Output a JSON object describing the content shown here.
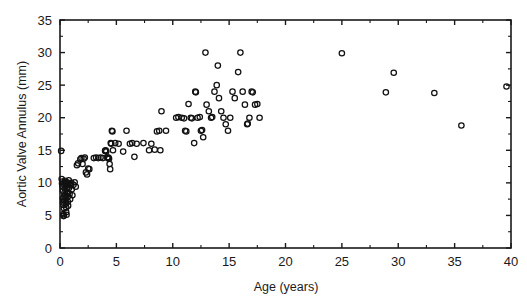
{
  "chart_data": {
    "type": "scatter",
    "title": "",
    "xlabel": "Age  (years)",
    "ylabel": "Aortic Valve Annulus (mm)",
    "xlim": [
      0,
      40
    ],
    "ylim": [
      0,
      35
    ],
    "x_major_ticks": [
      0,
      5,
      10,
      15,
      20,
      25,
      30,
      35,
      40
    ],
    "y_major_ticks": [
      0,
      5,
      10,
      15,
      20,
      25,
      30,
      35
    ],
    "x_tick_labels": [
      "0",
      "5",
      "10",
      "15",
      "20",
      "25",
      "30",
      "35",
      "40"
    ],
    "y_tick_labels": [
      "0",
      "5",
      "10",
      "15",
      "20",
      "25",
      "30",
      "35"
    ],
    "x_minor_interval": 2.5,
    "y_minor_interval": 2.5,
    "grid": false,
    "legend": null,
    "marker": "open-circle",
    "marker_color": "#111111",
    "background_color": "#ffffff",
    "frame": "box",
    "tick_direction": "in",
    "series": [
      {
        "name": "Aortic valve annulus vs age",
        "points": [
          [
            0.1,
            14.9
          ],
          [
            0.15,
            10.6
          ],
          [
            0.18,
            9.9
          ],
          [
            0.2,
            10.2
          ],
          [
            0.22,
            9.4
          ],
          [
            0.25,
            8.8
          ],
          [
            0.25,
            7.6
          ],
          [
            0.28,
            7.0
          ],
          [
            0.3,
            6.6
          ],
          [
            0.3,
            5.2
          ],
          [
            0.32,
            4.9
          ],
          [
            0.33,
            5.0
          ],
          [
            0.35,
            6.1
          ],
          [
            0.35,
            7.3
          ],
          [
            0.38,
            8.0
          ],
          [
            0.4,
            8.5
          ],
          [
            0.4,
            9.6
          ],
          [
            0.42,
            10.0
          ],
          [
            0.45,
            10.3
          ],
          [
            0.45,
            9.1
          ],
          [
            0.48,
            8.2
          ],
          [
            0.5,
            7.8
          ],
          [
            0.5,
            7.2
          ],
          [
            0.52,
            6.8
          ],
          [
            0.55,
            6.2
          ],
          [
            0.55,
            5.5
          ],
          [
            0.58,
            5.1
          ],
          [
            0.6,
            8.6
          ],
          [
            0.6,
            9.8
          ],
          [
            0.62,
            10.1
          ],
          [
            0.65,
            9.3
          ],
          [
            0.68,
            8.4
          ],
          [
            0.7,
            7.9
          ],
          [
            0.7,
            7.1
          ],
          [
            0.72,
            6.5
          ],
          [
            0.75,
            9.9
          ],
          [
            0.78,
            10.4
          ],
          [
            0.8,
            9.2
          ],
          [
            0.85,
            8.3
          ],
          [
            0.9,
            7.5
          ],
          [
            0.95,
            9.6
          ],
          [
            1.0,
            10.0
          ],
          [
            1.05,
            9.0
          ],
          [
            1.1,
            8.1
          ],
          [
            1.2,
            9.7
          ],
          [
            1.3,
            10.1
          ],
          [
            1.4,
            9.4
          ],
          [
            1.5,
            12.7
          ],
          [
            1.6,
            13.0
          ],
          [
            1.8,
            13.6
          ],
          [
            1.9,
            13.8
          ],
          [
            2.0,
            12.9
          ],
          [
            2.1,
            13.7
          ],
          [
            2.2,
            13.9
          ],
          [
            2.3,
            11.6
          ],
          [
            2.4,
            11.3
          ],
          [
            2.5,
            12.2
          ],
          [
            2.6,
            12.1
          ],
          [
            3.0,
            13.8
          ],
          [
            3.2,
            13.9
          ],
          [
            3.4,
            13.8
          ],
          [
            3.6,
            13.9
          ],
          [
            3.8,
            13.8
          ],
          [
            4.0,
            14.9
          ],
          [
            4.05,
            15.0
          ],
          [
            4.1,
            14.8
          ],
          [
            4.2,
            13.9
          ],
          [
            4.25,
            13.8
          ],
          [
            4.3,
            13.9
          ],
          [
            4.35,
            13.7
          ],
          [
            4.4,
            12.9
          ],
          [
            4.45,
            12.1
          ],
          [
            4.5,
            16.1
          ],
          [
            4.55,
            16.0
          ],
          [
            4.6,
            18.0
          ],
          [
            4.65,
            17.9
          ],
          [
            4.7,
            15.0
          ],
          [
            4.9,
            16.1
          ],
          [
            5.2,
            16.0
          ],
          [
            5.6,
            14.8
          ],
          [
            5.9,
            18.0
          ],
          [
            6.2,
            16.0
          ],
          [
            6.4,
            16.1
          ],
          [
            6.6,
            14.0
          ],
          [
            6.8,
            16.0
          ],
          [
            7.4,
            16.1
          ],
          [
            7.9,
            15.0
          ],
          [
            8.1,
            16.0
          ],
          [
            8.4,
            15.1
          ],
          [
            8.6,
            17.9
          ],
          [
            8.8,
            18.0
          ],
          [
            8.9,
            15.0
          ],
          [
            9.0,
            21.0
          ],
          [
            9.4,
            18.0
          ],
          [
            10.3,
            20.0
          ],
          [
            10.5,
            20.1
          ],
          [
            10.8,
            20.0
          ],
          [
            11.0,
            19.9
          ],
          [
            11.1,
            18.0
          ],
          [
            11.2,
            17.9
          ],
          [
            11.4,
            22.1
          ],
          [
            11.6,
            20.0
          ],
          [
            11.7,
            19.9
          ],
          [
            11.9,
            16.1
          ],
          [
            12.0,
            24.0
          ],
          [
            12.05,
            23.9
          ],
          [
            12.2,
            20.0
          ],
          [
            12.4,
            20.1
          ],
          [
            12.5,
            18.0
          ],
          [
            12.6,
            18.1
          ],
          [
            12.7,
            17.0
          ],
          [
            12.9,
            30.0
          ],
          [
            13.0,
            22.0
          ],
          [
            13.2,
            21.0
          ],
          [
            13.4,
            20.0
          ],
          [
            13.5,
            20.1
          ],
          [
            13.7,
            24.0
          ],
          [
            13.9,
            25.0
          ],
          [
            14.0,
            28.0
          ],
          [
            14.1,
            23.0
          ],
          [
            14.3,
            21.0
          ],
          [
            14.5,
            20.0
          ],
          [
            14.7,
            19.0
          ],
          [
            14.9,
            18.0
          ],
          [
            15.1,
            20.0
          ],
          [
            15.3,
            24.0
          ],
          [
            15.5,
            23.0
          ],
          [
            15.8,
            27.0
          ],
          [
            16.0,
            30.0
          ],
          [
            16.2,
            24.0
          ],
          [
            16.4,
            22.0
          ],
          [
            16.6,
            19.0
          ],
          [
            16.65,
            19.1
          ],
          [
            16.8,
            20.0
          ],
          [
            17.0,
            24.0
          ],
          [
            17.1,
            23.9
          ],
          [
            17.3,
            22.0
          ],
          [
            17.5,
            22.1
          ],
          [
            17.7,
            20.0
          ],
          [
            25.0,
            29.9
          ],
          [
            28.9,
            23.9
          ],
          [
            29.6,
            26.9
          ],
          [
            33.2,
            23.8
          ],
          [
            35.6,
            18.8
          ],
          [
            39.6,
            24.8
          ]
        ]
      }
    ]
  },
  "plot_geometry": {
    "left_px": 60,
    "right_px": 511,
    "top_px": 20,
    "bottom_px": 248
  }
}
